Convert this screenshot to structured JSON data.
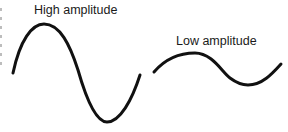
{
  "diagram": {
    "waves": [
      {
        "id": "high",
        "label": "High amplitude",
        "stroke_color": "#111111",
        "stroke_width": 3,
        "path": "M13,73 C20,40 32,24 44,24 C60,24 70,45 78,70 C86,98 96,122 107,122 C120,122 132,100 140,75"
      },
      {
        "id": "low",
        "label": "Low amplitude",
        "stroke_color": "#111111",
        "stroke_width": 3,
        "path": "M154,72 C166,58 180,53 195,53 C212,53 222,72 230,78 C238,84 243,85 248,85 C262,85 272,74 281,64"
      }
    ]
  }
}
